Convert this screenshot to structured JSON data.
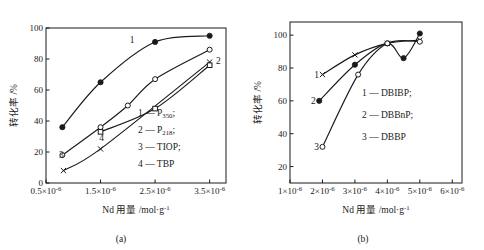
{
  "figure": {
    "panels": [
      {
        "id": "a",
        "caption": "(a)",
        "xlabel_main": "Nd 用量 /mol",
        "xlabel_unit": "·g",
        "xlabel_exp": "-1",
        "ylabel": "转化率 /%",
        "legend": [
          {
            "key": "1",
            "dash": "—",
            "name": "P",
            "sub": "350",
            "tail": ";"
          },
          {
            "key": "2",
            "dash": "—",
            "name": "P",
            "sub": "218",
            "tail": ";"
          },
          {
            "key": "3",
            "dash": "—",
            "name": "TIOP",
            "sub": "",
            "tail": ";"
          },
          {
            "key": "4",
            "dash": "—",
            "name": "TBP",
            "sub": "",
            "tail": ""
          }
        ],
        "curve_labels": [
          {
            "text": "1",
            "x": 2.08,
            "y": 92
          },
          {
            "text": "2",
            "x": 3.66,
            "y": 79
          },
          {
            "text": "3",
            "x": 0.78,
            "y": 18
          },
          {
            "text": "4",
            "x": 1.52,
            "y": 29
          }
        ]
      },
      {
        "id": "b",
        "caption": "(b)",
        "xlabel_main": "Nd 用量 /mol",
        "xlabel_unit": "·g",
        "xlabel_exp": "-1",
        "ylabel": "转化率 /%",
        "legend": [
          {
            "key": "1",
            "dash": "—",
            "name": "DBIBP",
            "sub": "",
            "tail": ";"
          },
          {
            "key": "2",
            "dash": "—",
            "name": "DBBnP",
            "sub": "",
            "tail": ";"
          },
          {
            "key": "3",
            "dash": "—",
            "name": "DBBP",
            "sub": "",
            "tail": ""
          }
        ],
        "curve_labels": [
          {
            "text": "1",
            "x": 1.82,
            "y": 76
          },
          {
            "text": "2",
            "x": 1.72,
            "y": 60
          },
          {
            "text": "3",
            "x": 1.82,
            "y": 32
          }
        ]
      }
    ]
  },
  "chart_data": [
    {
      "type": "line",
      "panel": "a",
      "title": "",
      "xlabel": "Nd 用量 /mol·g-1",
      "ylabel": "转化率 /%",
      "xlim": [
        0.5,
        3.8
      ],
      "ylim": [
        0,
        100
      ],
      "xticks": [
        {
          "value": 0.5,
          "label_base": "0.5×10",
          "label_exp": "-6"
        },
        {
          "value": 1.5,
          "label_base": "1.5×10",
          "label_exp": "-6"
        },
        {
          "value": 2.5,
          "label_base": "2.5×10",
          "label_exp": "-6"
        },
        {
          "value": 3.5,
          "label_base": "3.5×10",
          "label_exp": "-6"
        }
      ],
      "yticks": [
        0,
        20,
        40,
        60,
        80,
        100
      ],
      "grid": false,
      "legend_position": "inside-right",
      "series": [
        {
          "name": "P350",
          "label": "1",
          "marker": "filled-circle",
          "x": [
            0.8,
            1.5,
            2.5,
            3.5
          ],
          "y": [
            36,
            65,
            91,
            95
          ]
        },
        {
          "name": "P218",
          "label": "2",
          "marker": "open-circle",
          "x": [
            0.8,
            1.5,
            2.0,
            2.5,
            3.5
          ],
          "y": [
            18,
            36,
            50,
            67,
            86
          ]
        },
        {
          "name": "TIOP",
          "label": "3",
          "marker": "cross",
          "x": [
            0.82,
            1.5,
            3.5
          ],
          "y": [
            8,
            22,
            78
          ]
        },
        {
          "name": "TBP",
          "label": "4",
          "marker": "open-square",
          "x": [
            1.5,
            2.5,
            3.5
          ],
          "y": [
            33,
            48,
            76
          ]
        }
      ]
    },
    {
      "type": "line",
      "panel": "b",
      "title": "",
      "xlabel": "Nd 用量 /mol·g-1",
      "ylabel": "转化率 /%",
      "xlim": [
        1.0,
        6.3
      ],
      "ylim": [
        10,
        108
      ],
      "xticks": [
        {
          "value": 1,
          "label_base": "1×10",
          "label_exp": "-6"
        },
        {
          "value": 2,
          "label_base": "2×10",
          "label_exp": "-6"
        },
        {
          "value": 3,
          "label_base": "3×10",
          "label_exp": "-6"
        },
        {
          "value": 4,
          "label_base": "4×10",
          "label_exp": "-6"
        },
        {
          "value": 5,
          "label_base": "5×10",
          "label_exp": "-6"
        },
        {
          "value": 6,
          "label_base": "6×10",
          "label_exp": "-6"
        }
      ],
      "yticks": [
        20,
        40,
        60,
        80,
        100
      ],
      "grid": false,
      "legend_position": "inside-right",
      "series": [
        {
          "name": "DBIBP",
          "label": "1",
          "marker": "cross",
          "x": [
            2.0,
            3.0,
            4.0,
            5.0
          ],
          "y": [
            76,
            88,
            95,
            97
          ]
        },
        {
          "name": "DBBnP",
          "label": "2",
          "marker": "filled-circle",
          "x": [
            1.9,
            3.0,
            4.0,
            4.5,
            5.0
          ],
          "y": [
            60,
            82,
            95,
            86,
            101
          ]
        },
        {
          "name": "DBBP",
          "label": "3",
          "marker": "open-circle",
          "x": [
            2.0,
            3.1,
            4.0,
            5.0
          ],
          "y": [
            32,
            76,
            95,
            96
          ]
        }
      ]
    }
  ]
}
